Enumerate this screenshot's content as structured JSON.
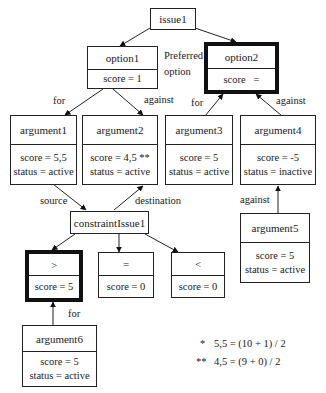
{
  "diagram": {
    "nodes": {
      "issue1": {
        "title": "issue1"
      },
      "option1": {
        "title": "option1",
        "score": "score = 1"
      },
      "option2": {
        "title": "option2",
        "score": "score   =",
        "highlighted": true
      },
      "argument1": {
        "title": "argument1",
        "score": "score = 5,5",
        "status": "status = active"
      },
      "argument2": {
        "title": "argument2",
        "score": "score = 4,5 **",
        "status": "status = active"
      },
      "argument3": {
        "title": "argument3",
        "score": "score = 5",
        "status": "status = active"
      },
      "argument4": {
        "title": "argument4",
        "score": "score = -5",
        "status": "status = inactive"
      },
      "argument5": {
        "title": "argument5",
        "score": "score = 5",
        "status": "status = active"
      },
      "argument6": {
        "title": "argument6",
        "score": "score = 5",
        "status": "status = active"
      },
      "constraintIssue1": {
        "title": "constraintIssue1"
      },
      "gt": {
        "title": ">",
        "score": "score = 5",
        "highlighted": true
      },
      "eq": {
        "title": "=",
        "score": "score = 0"
      },
      "lt": {
        "title": "<",
        "score": "score = 0"
      }
    },
    "edge_labels": {
      "preferred_line1": "Preferred",
      "preferred_line2": "option",
      "opt1_for": "for",
      "opt1_against": "against",
      "opt2_for": "for",
      "opt2_against": "against",
      "source": "source",
      "destination": "destination",
      "arg5_against": "against",
      "arg6_for": "for"
    },
    "footnotes": [
      {
        "marker": "*",
        "text": "5,5 = (10 + 1) / 2"
      },
      {
        "marker": "**",
        "text": "4,5 = (9 + 0) / 2"
      }
    ]
  }
}
